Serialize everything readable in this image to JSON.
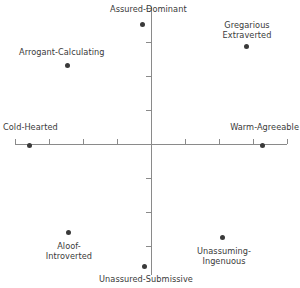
{
  "chart_data": {
    "type": "scatter",
    "title": "",
    "subtitle": "",
    "xlabel": "",
    "ylabel": "",
    "xlim": [
      -4,
      4
    ],
    "ylim": [
      -4,
      4
    ],
    "grid": false,
    "legend": "none",
    "x_ticks": [
      -4,
      -3,
      -2,
      -1,
      0,
      1,
      2,
      3,
      4
    ],
    "y_ticks": [
      -4,
      -3,
      -2,
      -1,
      0,
      1,
      2,
      3,
      4
    ],
    "x_tick_labels": [
      "",
      "",
      "",
      "",
      "",
      "",
      "",
      "",
      ""
    ],
    "y_tick_labels": [
      "",
      "",
      "",
      "",
      "",
      "",
      "",
      "",
      ""
    ],
    "axis_style": "crossed-at-origin",
    "point_color": "#3a3a3a",
    "axis_color": "#8a8a8a",
    "points": [
      {
        "label": "Assured-Dominant",
        "label_lines": [
          "Assured-Dominant"
        ],
        "x": -0.26,
        "y": 3.53,
        "px": 142,
        "py": 24,
        "label_px": 110,
        "label_py": 4,
        "label_align": "lbl-left",
        "label_width": 84
      },
      {
        "label": "Gregarious Extraverted",
        "label_lines": [
          "Gregarious",
          "Extraverted"
        ],
        "x": 2.79,
        "y": 2.88,
        "px": 246,
        "py": 46,
        "label_px": 211,
        "label_py": 20,
        "label_align": "lbl-center",
        "label_width": 72
      },
      {
        "label": "Arrogant-Calculating",
        "label_lines": [
          "Arrogant-Calculating"
        ],
        "x": -2.47,
        "y": 2.32,
        "px": 67,
        "py": 65,
        "label_px": 19,
        "label_py": 47,
        "label_align": "lbl-left",
        "label_width": 98
      },
      {
        "label": "Cold-Hearted",
        "label_lines": [
          "Cold-Hearted"
        ],
        "x": -3.59,
        "y": 0.0,
        "px": 29,
        "py": 145,
        "label_px": 3,
        "label_py": 122,
        "label_align": "lbl-left",
        "label_width": 66
      },
      {
        "label": "Warm-Agreeable",
        "label_lines": [
          "Warm-Agreeable"
        ],
        "x": 3.26,
        "y": 0.0,
        "px": 262,
        "py": 145,
        "label_px": 223,
        "label_py": 122,
        "label_align": "lbl-right",
        "label_width": 76
      },
      {
        "label": "Aloof-Introverted",
        "label_lines": [
          "Aloof-",
          "Introverted"
        ],
        "x": -2.44,
        "y": -2.59,
        "px": 68,
        "py": 232,
        "label_px": 34,
        "label_py": 241,
        "label_align": "lbl-center",
        "label_width": 70
      },
      {
        "label": "Unassuming-Ingenuous",
        "label_lines": [
          "Unassuming-",
          "Ingenuous"
        ],
        "x": 2.09,
        "y": -2.74,
        "px": 222,
        "py": 237,
        "label_px": 182,
        "label_py": 246,
        "label_align": "lbl-center",
        "label_width": 84
      },
      {
        "label": "Unassured-Submissive",
        "label_lines": [
          "Unassured-Submissive"
        ],
        "x": -0.21,
        "y": -3.59,
        "px": 144,
        "py": 266,
        "label_px": 63,
        "label_py": 274,
        "label_align": "lbl-center",
        "label_width": 166
      }
    ]
  }
}
